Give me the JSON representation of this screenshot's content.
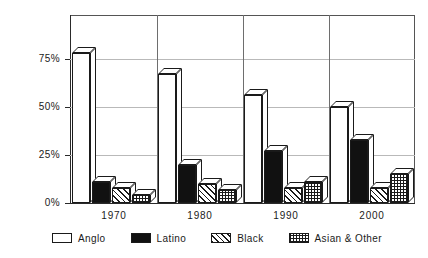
{
  "chart_data": {
    "type": "bar",
    "title": "",
    "subtitle": "",
    "xlabel": "",
    "ylabel": "",
    "categories": [
      "1970",
      "1980",
      "1990",
      "2000"
    ],
    "series": [
      {
        "name": "Anglo",
        "values": [
          78,
          67,
          56,
          50
        ],
        "fill": "white",
        "color": "#ffffff"
      },
      {
        "name": "Latino",
        "values": [
          11,
          20,
          27,
          33
        ],
        "fill": "solid-black",
        "color": "#111111"
      },
      {
        "name": "Black",
        "values": [
          8,
          10,
          8,
          8
        ],
        "fill": "diagonal-hatch",
        "color": "#ffffff"
      },
      {
        "name": "Asian & Other",
        "values": [
          4,
          7,
          11,
          15
        ],
        "fill": "cross-grid",
        "color": "#ffffff"
      }
    ],
    "ylim": [
      0,
      87.5
    ],
    "yticks": [
      0,
      25,
      50,
      75
    ],
    "ytick_labels": [
      "0%",
      "25%",
      "50%",
      "75%"
    ],
    "grid": true,
    "legend_position": "bottom",
    "bar_style": "3d-extruded",
    "outline_color": "#1a1a1a",
    "gridline_color": "#b9b9b9",
    "axis_color": "#2a2a2a"
  },
  "legend": {
    "items": [
      {
        "label": "Anglo"
      },
      {
        "label": "Latino"
      },
      {
        "label": "Black"
      },
      {
        "label": "Asian & Other"
      }
    ]
  }
}
